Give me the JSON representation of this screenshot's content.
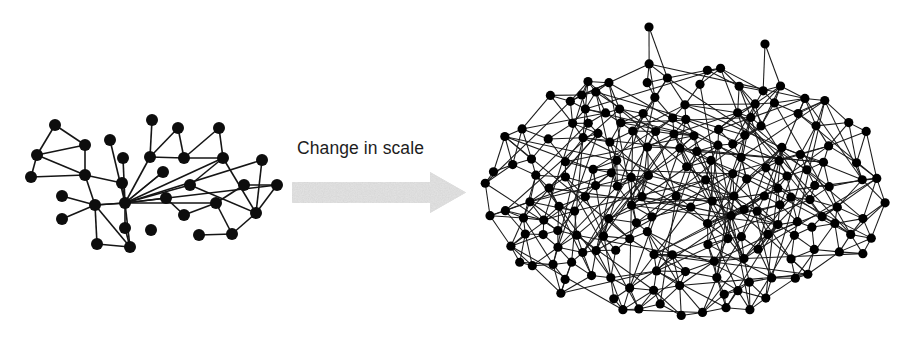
{
  "figure": {
    "caption": "Change in scale",
    "arrow": {
      "name": "change-in-scale-arrow",
      "fill": "#c9c9c9",
      "shaft": {
        "x": 292,
        "y": 182,
        "width": 138,
        "height": 21
      },
      "head": {
        "x": 430,
        "y": 172,
        "width": 36,
        "height": 41
      },
      "texture": "speckled-gray"
    },
    "colors": {
      "background": "#ffffff",
      "node": "#0d0d0d",
      "edge": "#151515",
      "text": "#1d1d1d",
      "arrow": "#c9c9c9"
    }
  },
  "left_network": {
    "name": "sparse-network",
    "node_count": 33,
    "node_radius": 6,
    "edge_width": 1.6,
    "description": "Sparse graph with a single high-degree hub node",
    "nodes": [
      [
        55,
        125
      ],
      [
        37,
        155
      ],
      [
        31,
        177
      ],
      [
        85,
        145
      ],
      [
        85,
        175
      ],
      [
        110,
        140
      ],
      [
        123,
        158
      ],
      [
        152,
        120
      ],
      [
        150,
        157
      ],
      [
        178,
        128
      ],
      [
        184,
        158
      ],
      [
        219,
        128
      ],
      [
        223,
        158
      ],
      [
        125,
        203
      ],
      [
        95,
        205
      ],
      [
        163,
        172
      ],
      [
        166,
        198
      ],
      [
        184,
        215
      ],
      [
        216,
        203
      ],
      [
        190,
        185
      ],
      [
        256,
        213
      ],
      [
        277,
        185
      ],
      [
        232,
        234
      ],
      [
        151,
        230
      ],
      [
        125,
        228
      ],
      [
        62,
        219
      ],
      [
        97,
        244
      ],
      [
        130,
        247
      ],
      [
        62,
        196
      ],
      [
        199,
        235
      ],
      [
        244,
        185
      ],
      [
        122,
        183
      ],
      [
        262,
        160
      ]
    ],
    "edges": [
      [
        0,
        1
      ],
      [
        0,
        3
      ],
      [
        1,
        3
      ],
      [
        1,
        4
      ],
      [
        1,
        2
      ],
      [
        2,
        4
      ],
      [
        3,
        4
      ],
      [
        4,
        14
      ],
      [
        4,
        31
      ],
      [
        5,
        13
      ],
      [
        6,
        13
      ],
      [
        7,
        8
      ],
      [
        8,
        9
      ],
      [
        8,
        13
      ],
      [
        9,
        10
      ],
      [
        8,
        10
      ],
      [
        10,
        11
      ],
      [
        11,
        12
      ],
      [
        10,
        12
      ],
      [
        12,
        20
      ],
      [
        12,
        19
      ],
      [
        13,
        14
      ],
      [
        13,
        15
      ],
      [
        13,
        16
      ],
      [
        13,
        18
      ],
      [
        13,
        21
      ],
      [
        13,
        24
      ],
      [
        13,
        27
      ],
      [
        13,
        31
      ],
      [
        13,
        32
      ],
      [
        14,
        25
      ],
      [
        14,
        26
      ],
      [
        14,
        28
      ],
      [
        14,
        27
      ],
      [
        15,
        13
      ],
      [
        16,
        17
      ],
      [
        17,
        18
      ],
      [
        18,
        22
      ],
      [
        19,
        20
      ],
      [
        19,
        13
      ],
      [
        20,
        22
      ],
      [
        20,
        21
      ],
      [
        21,
        30
      ],
      [
        22,
        29
      ],
      [
        24,
        27
      ],
      [
        26,
        27
      ],
      [
        12,
        13
      ],
      [
        18,
        30
      ],
      [
        20,
        32
      ],
      [
        14,
        13
      ]
    ]
  },
  "right_network": {
    "name": "dense-network",
    "node_count": 181,
    "node_radius": 4.6,
    "edge_width": 1.05,
    "description": "Dense elliptical hairball graph with many crossing edges and two upper outlier nodes",
    "ellipse": {
      "cx": 685,
      "cy": 190,
      "rx": 205,
      "ry": 130
    },
    "outliers": [
      [
        649,
        27
      ],
      [
        765,
        44
      ]
    ],
    "seed": 20240917,
    "target_edges": 620
  }
}
